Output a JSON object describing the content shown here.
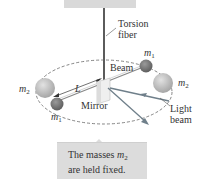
{
  "diagram": {
    "labels": {
      "torsion_fiber_line1": "Torsion",
      "torsion_fiber_line2": "fiber",
      "beam": "Beam",
      "mirror": "Mirror",
      "light_beam_line1": "Light",
      "light_beam_line2": "beam",
      "length": "L",
      "m1_symbol": "m",
      "m1_sub": "1",
      "m2_symbol": "m",
      "m2_sub": "2"
    },
    "caption": {
      "line1_prefix": "The masses ",
      "line1_symbol": "m",
      "line1_sub": "2",
      "line2": "are held fixed."
    },
    "colors": {
      "ceiling": "#d9d9d9",
      "fiber": "#333333",
      "small_mass": "#7a7a7a",
      "large_mass": "#bdbdbd",
      "mirror": "#eeeeee",
      "light_beam": "#6f7f8a",
      "caption_bg": "#dcdcdc"
    }
  }
}
